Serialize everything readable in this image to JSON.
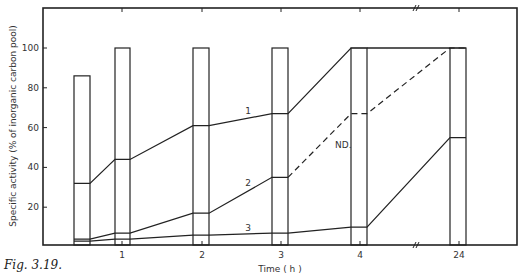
{
  "caption": "Fig. 3.19.",
  "chart_data": {
    "type": "line",
    "title": "",
    "xlabel": "Time ( h )",
    "ylabel": "Specific activity (% of inorganic carbon pool)",
    "x_tick_labels": [
      "1",
      "2",
      "3",
      "4",
      "24"
    ],
    "y_tick_labels": [
      "20",
      "40",
      "60",
      "80",
      "100"
    ],
    "ylim": [
      0,
      118
    ],
    "axis_break": "between 4 and 24 h",
    "bars": {
      "description": "Open rectangles representing inorganic carbon pool (100%) at sampling times",
      "x": [
        "0.5",
        "1",
        "2",
        "3",
        "4",
        "24"
      ],
      "values": [
        86,
        100,
        100,
        100,
        100,
        100
      ]
    },
    "series": [
      {
        "name": "1",
        "x": [
          "0.5",
          "1",
          "2",
          "3",
          "4",
          "24"
        ],
        "values": [
          32,
          44,
          61,
          67,
          100,
          100
        ]
      },
      {
        "name": "2",
        "x": [
          "0.5",
          "1",
          "2",
          "3",
          "4",
          "24"
        ],
        "values": [
          4,
          7,
          17,
          35,
          67,
          100
        ],
        "note": "dashed 3→24 h, ND."
      },
      {
        "name": "3",
        "x": [
          "0.5",
          "1",
          "2",
          "3",
          "4",
          "24"
        ],
        "values": [
          3,
          4,
          6,
          7,
          10,
          55
        ]
      }
    ],
    "annotations": [
      "ND."
    ],
    "grid": false,
    "legend": "inline curve labels 1, 2, 3"
  }
}
